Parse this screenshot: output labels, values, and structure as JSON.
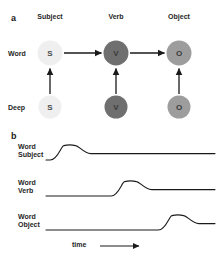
{
  "figure": {
    "width": 221,
    "height": 263,
    "background": "#ffffff"
  },
  "panel_a": {
    "letter": "a",
    "column_headers": [
      {
        "label": "Subject",
        "x": 50
      },
      {
        "label": "Verb",
        "x": 116
      },
      {
        "label": "Object",
        "x": 179
      }
    ],
    "row_labels": [
      {
        "label": "Word",
        "x": 8,
        "y": 53
      },
      {
        "label": "Deep",
        "x": 8,
        "y": 107
      }
    ],
    "nodes": [
      {
        "id": "word-subject",
        "letter": "S",
        "row": "Word",
        "column": "Subject",
        "shade": "light",
        "color": "#efefef",
        "x": 50,
        "y": 53,
        "size": 25
      },
      {
        "id": "word-verb",
        "letter": "V",
        "row": "Word",
        "column": "Verb",
        "shade": "dark",
        "color": "#6f6f6f",
        "x": 116,
        "y": 53,
        "size": 25
      },
      {
        "id": "word-object",
        "letter": "O",
        "row": "Word",
        "column": "Object",
        "shade": "mid",
        "color": "#9d9d9d",
        "x": 179,
        "y": 53,
        "size": 25
      },
      {
        "id": "deep-subject",
        "letter": "S",
        "row": "Deep",
        "column": "Subject",
        "shade": "light",
        "color": "#efefef",
        "x": 50,
        "y": 107,
        "size": 23
      },
      {
        "id": "deep-verb",
        "letter": "V",
        "row": "Deep",
        "column": "Verb",
        "shade": "dark",
        "color": "#6f6f6f",
        "x": 116,
        "y": 107,
        "size": 23
      },
      {
        "id": "deep-object",
        "letter": "O",
        "row": "Deep",
        "column": "Object",
        "shade": "mid",
        "color": "#9d9d9d",
        "x": 179,
        "y": 107,
        "size": 23
      }
    ],
    "arrows": [
      {
        "id": "arrow-subject-to-verb",
        "from": "word-subject",
        "to": "word-verb",
        "direction": "right"
      },
      {
        "id": "arrow-verb-to-object",
        "from": "word-verb",
        "to": "word-object",
        "direction": "right"
      },
      {
        "id": "arrow-deep-subject-to-word",
        "from": "deep-subject",
        "to": "word-subject",
        "direction": "up"
      },
      {
        "id": "arrow-deep-verb-to-word",
        "from": "deep-verb",
        "to": "word-verb",
        "direction": "up"
      },
      {
        "id": "arrow-deep-object-to-word",
        "from": "deep-object",
        "to": "word-object",
        "direction": "up"
      }
    ]
  },
  "panel_b": {
    "letter": "b",
    "traces": [
      {
        "id": "trace-word-subject",
        "label_line1": "Word",
        "label_line2": "Subject",
        "peak_time": 0.14
      },
      {
        "id": "trace-word-verb",
        "label_line1": "Word",
        "label_line2": "Verb",
        "peak_time": 0.5
      },
      {
        "id": "trace-word-object",
        "label_line1": "Word",
        "label_line2": "Object",
        "peak_time": 0.78
      }
    ],
    "axis": {
      "label": "time",
      "arrow": "right"
    }
  },
  "chart_data": {
    "type": "line",
    "title": "",
    "xlabel": "time",
    "ylabel": "",
    "grid": false,
    "legend": "none",
    "xlim": [
      0,
      1
    ],
    "ylim": [
      0,
      1
    ],
    "series": [
      {
        "name": "Word Subject",
        "x": [
          0.0,
          0.05,
          0.1,
          0.14,
          0.18,
          0.23,
          0.3,
          0.5,
          1.0
        ],
        "y": [
          0.0,
          0.05,
          0.62,
          0.9,
          0.85,
          0.45,
          0.4,
          0.4,
          0.4
        ],
        "peak_x": 0.14,
        "peak_y": 0.9,
        "baseline_before": 0.0,
        "baseline_after": 0.4
      },
      {
        "name": "Word Verb",
        "x": [
          0.0,
          0.25,
          0.35,
          0.42,
          0.5,
          0.56,
          0.62,
          0.7,
          1.0
        ],
        "y": [
          0.0,
          0.0,
          0.05,
          0.55,
          0.9,
          0.8,
          0.42,
          0.4,
          0.4
        ],
        "peak_x": 0.5,
        "peak_y": 0.9,
        "baseline_before": 0.0,
        "baseline_after": 0.4
      },
      {
        "name": "Word Object",
        "x": [
          0.0,
          0.55,
          0.65,
          0.72,
          0.78,
          0.84,
          0.9,
          0.95,
          1.0
        ],
        "y": [
          0.0,
          0.02,
          0.06,
          0.55,
          0.9,
          0.82,
          0.42,
          0.4,
          0.4
        ],
        "peak_x": 0.78,
        "peak_y": 0.9,
        "baseline_before": 0.0,
        "baseline_after": 0.4
      }
    ]
  },
  "colors": {
    "stroke": "#1a1a1a",
    "text": "#262626",
    "node_light": "#efefef",
    "node_mid": "#9d9d9d",
    "node_dark": "#6f6f6f"
  }
}
